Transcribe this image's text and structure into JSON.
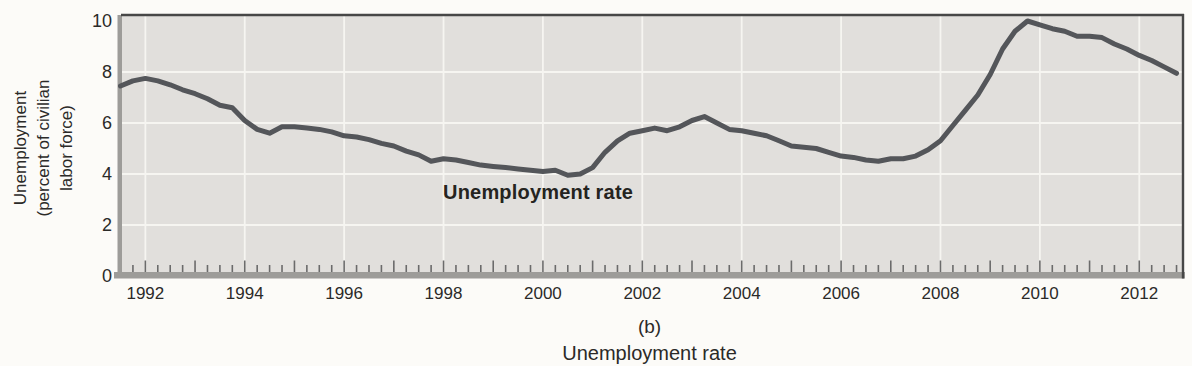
{
  "figure": {
    "y_axis": {
      "title_lines": [
        "Unemployment",
        "(percent of civilian",
        "labor force)"
      ],
      "tick_labels": [
        0,
        2,
        4,
        6,
        8,
        10
      ]
    },
    "x_axis": {
      "labeled_years": [
        1992,
        1994,
        1996,
        1998,
        2000,
        2002,
        2004,
        2006,
        2008,
        2010,
        2012
      ],
      "minor_tick_interval_years": 0.25,
      "minor_tick_start": 1991.75,
      "minor_tick_end": 2012.75
    },
    "series_label": "Unemployment rate",
    "caption_letter": "(b)",
    "caption_title": "Unemployment rate",
    "colors": {
      "page_bg": "#fcfbf8",
      "plot_bg": "#e1dfdc",
      "grid": "#f6f5f1",
      "line": "#54565a",
      "frame": "#474747",
      "axis_band": "#9d9c99",
      "tick": "#6b6b6b",
      "text": "#2b2a28"
    }
  },
  "chart_data": {
    "type": "line",
    "title": "",
    "xlabel": "(b) Unemployment rate",
    "ylabel": "Unemployment (percent of civilian labor force)",
    "xlim": [
      1991.53,
      2012.88
    ],
    "ylim": [
      0,
      10
    ],
    "y_ticks": [
      0,
      2,
      4,
      6,
      8,
      10
    ],
    "x_ticks_labeled": [
      1992,
      1994,
      1996,
      1998,
      2000,
      2002,
      2004,
      2006,
      2008,
      2010,
      2012
    ],
    "grid": true,
    "grid_color": "white",
    "legend_position": "none",
    "annotation": "Unemployment rate",
    "series": [
      {
        "name": "Unemployment rate",
        "units": "percent of civilian labor force",
        "points": [
          [
            1991.5,
            7.45
          ],
          [
            1991.75,
            7.65
          ],
          [
            1992.0,
            7.75
          ],
          [
            1992.25,
            7.65
          ],
          [
            1992.5,
            7.5
          ],
          [
            1992.75,
            7.3
          ],
          [
            1993.0,
            7.15
          ],
          [
            1993.25,
            6.95
          ],
          [
            1993.5,
            6.7
          ],
          [
            1993.75,
            6.6
          ],
          [
            1994.0,
            6.1
          ],
          [
            1994.25,
            5.75
          ],
          [
            1994.5,
            5.6
          ],
          [
            1994.75,
            5.85
          ],
          [
            1995.0,
            5.85
          ],
          [
            1995.25,
            5.8
          ],
          [
            1995.5,
            5.75
          ],
          [
            1995.75,
            5.65
          ],
          [
            1996.0,
            5.5
          ],
          [
            1996.25,
            5.45
          ],
          [
            1996.5,
            5.35
          ],
          [
            1996.75,
            5.2
          ],
          [
            1997.0,
            5.1
          ],
          [
            1997.25,
            4.9
          ],
          [
            1997.5,
            4.75
          ],
          [
            1997.75,
            4.5
          ],
          [
            1998.0,
            4.6
          ],
          [
            1998.25,
            4.55
          ],
          [
            1998.5,
            4.45
          ],
          [
            1998.75,
            4.35
          ],
          [
            1999.0,
            4.3
          ],
          [
            1999.25,
            4.25
          ],
          [
            1999.5,
            4.2
          ],
          [
            1999.75,
            4.15
          ],
          [
            2000.0,
            4.1
          ],
          [
            2000.25,
            4.15
          ],
          [
            2000.5,
            3.95
          ],
          [
            2000.75,
            4.0
          ],
          [
            2001.0,
            4.25
          ],
          [
            2001.25,
            4.85
          ],
          [
            2001.5,
            5.3
          ],
          [
            2001.75,
            5.6
          ],
          [
            2002.0,
            5.7
          ],
          [
            2002.25,
            5.8
          ],
          [
            2002.5,
            5.7
          ],
          [
            2002.75,
            5.85
          ],
          [
            2003.0,
            6.1
          ],
          [
            2003.25,
            6.25
          ],
          [
            2003.5,
            6.0
          ],
          [
            2003.75,
            5.75
          ],
          [
            2004.0,
            5.7
          ],
          [
            2004.25,
            5.6
          ],
          [
            2004.5,
            5.5
          ],
          [
            2004.75,
            5.3
          ],
          [
            2005.0,
            5.1
          ],
          [
            2005.25,
            5.05
          ],
          [
            2005.5,
            5.0
          ],
          [
            2005.75,
            4.85
          ],
          [
            2006.0,
            4.7
          ],
          [
            2006.25,
            4.65
          ],
          [
            2006.5,
            4.55
          ],
          [
            2006.75,
            4.5
          ],
          [
            2007.0,
            4.6
          ],
          [
            2007.25,
            4.6
          ],
          [
            2007.5,
            4.7
          ],
          [
            2007.75,
            4.95
          ],
          [
            2008.0,
            5.3
          ],
          [
            2008.25,
            5.9
          ],
          [
            2008.5,
            6.5
          ],
          [
            2008.75,
            7.1
          ],
          [
            2009.0,
            7.9
          ],
          [
            2009.25,
            8.9
          ],
          [
            2009.5,
            9.6
          ],
          [
            2009.75,
            10.0
          ],
          [
            2010.0,
            9.85
          ],
          [
            2010.25,
            9.7
          ],
          [
            2010.5,
            9.6
          ],
          [
            2010.75,
            9.4
          ],
          [
            2011.0,
            9.4
          ],
          [
            2011.25,
            9.35
          ],
          [
            2011.5,
            9.1
          ],
          [
            2011.75,
            8.9
          ],
          [
            2012.0,
            8.65
          ],
          [
            2012.25,
            8.45
          ],
          [
            2012.5,
            8.2
          ],
          [
            2012.75,
            7.95
          ]
        ]
      }
    ]
  }
}
